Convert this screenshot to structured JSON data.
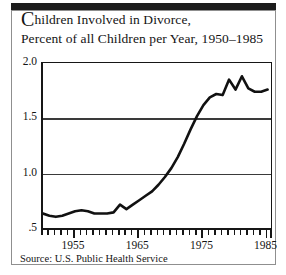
{
  "figure": {
    "title_line_1_dropcap": "C",
    "title_line_1_rest": "hildren Involved in Divorce,",
    "title_line_2": "Percent of all Children per Year, 1950–1985",
    "source": "Source: U.S. Public Health Service"
  },
  "chart_data": {
    "type": "line",
    "title": "Children Involved in Divorce, Percent of all Children per Year, 1950–1985",
    "xlabel": "",
    "ylabel": "",
    "xlim": [
      1950,
      1986
    ],
    "ylim": [
      0.5,
      2.0
    ],
    "grid": true,
    "gridlines_y": [
      1.0,
      1.5
    ],
    "legend": "none",
    "ytick_labels": [
      "2.0",
      "1.5",
      "1.0",
      ".5"
    ],
    "ytick_values": [
      2.0,
      1.5,
      1.0,
      0.5
    ],
    "xtick_labels": [
      "1955",
      "1965",
      "1975",
      "1985"
    ],
    "xtick_values": [
      1955,
      1965,
      1975,
      1985
    ],
    "line_color": "#111111",
    "x": [
      1950,
      1951,
      1952,
      1953,
      1954,
      1955,
      1956,
      1957,
      1958,
      1959,
      1960,
      1961,
      1962,
      1963,
      1964,
      1965,
      1966,
      1967,
      1968,
      1969,
      1970,
      1971,
      1972,
      1973,
      1974,
      1975,
      1976,
      1977,
      1978,
      1979,
      1980,
      1981,
      1982,
      1983,
      1984,
      1985
    ],
    "values": [
      0.64,
      0.62,
      0.61,
      0.62,
      0.64,
      0.66,
      0.67,
      0.66,
      0.64,
      0.64,
      0.64,
      0.65,
      0.72,
      0.68,
      0.72,
      0.76,
      0.8,
      0.84,
      0.9,
      0.97,
      1.05,
      1.15,
      1.27,
      1.4,
      1.52,
      1.62,
      1.69,
      1.72,
      1.71,
      1.85,
      1.76,
      1.88,
      1.77,
      1.74,
      1.74,
      1.76
    ]
  }
}
